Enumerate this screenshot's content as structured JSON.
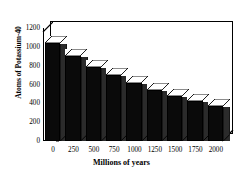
{
  "chart_data": {
    "type": "bar",
    "title": "",
    "xlabel": "Millions of years",
    "ylabel": "Atoms of Potassium-40",
    "categories": [
      "0",
      "250",
      "500",
      "750",
      "1000",
      "1250",
      "1500",
      "1750",
      "2000"
    ],
    "x": [
      0,
      250,
      500,
      750,
      1000,
      1250,
      1500,
      1750,
      2000
    ],
    "values": [
      1045,
      900,
      790,
      700,
      615,
      540,
      480,
      425,
      375
    ],
    "xlim": [
      -125,
      2125
    ],
    "ylim": [
      0,
      1200
    ],
    "ytick_values": [
      0,
      200,
      400,
      600,
      800,
      1000,
      1200
    ],
    "ytick_labels": [
      "0",
      "200",
      "400",
      "600",
      "800",
      "1000",
      "1200"
    ],
    "xtick_labels": [
      "0",
      "250",
      "500",
      "750",
      "1000",
      "1250",
      "1500",
      "1750",
      "2000"
    ],
    "grid": false,
    "legend": "none",
    "style": "3d-bar",
    "bar_color": "#0a0a0a",
    "bar_top_color": "#ffffff",
    "bar_side_color": "#2b2b2b",
    "axis_color": "#000000",
    "background_color": "#ffffff"
  }
}
